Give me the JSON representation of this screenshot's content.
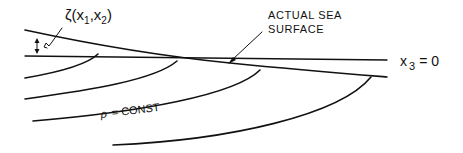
{
  "diagram": {
    "labels": {
      "zeta": "ζ(x",
      "zeta_sub1": "1",
      "zeta_mid": ",x",
      "zeta_sub2": "2",
      "zeta_close": ")",
      "actual_sea_line1": "ACTUAL  SEA",
      "actual_sea_line2": "SURFACE",
      "x3": "x",
      "x3_sub": "3",
      "x3_eq": "= 0",
      "rho": "ρ",
      "rho_eq": "= CONST"
    },
    "colors": {
      "ink": "#111111",
      "background": "#ffffff"
    }
  }
}
